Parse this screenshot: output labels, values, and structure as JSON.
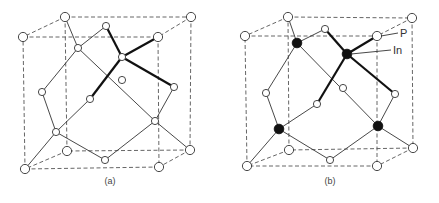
{
  "figure": {
    "panels": [
      {
        "id": "a",
        "caption": "(a)",
        "caption_pos": [
          110,
          184
        ],
        "cube_corners": {
          "back_tl": [
            65,
            17
          ],
          "back_tr": [
            191,
            17
          ],
          "back_bl": [
            67,
            151
          ],
          "back_br": [
            190,
            150
          ],
          "front_tl": [
            23,
            37
          ],
          "front_tr": [
            158,
            37
          ],
          "front_bl": [
            25,
            169
          ],
          "front_br": [
            159,
            167
          ]
        },
        "large_white_atoms": [
          [
            65,
            17
          ],
          [
            191,
            17
          ],
          [
            23,
            37
          ],
          [
            158,
            37
          ],
          [
            67,
            151
          ],
          [
            190,
            150
          ],
          [
            25,
            169
          ],
          [
            159,
            167
          ]
        ],
        "small_white_atoms": [
          [
            106,
            26
          ],
          [
            78,
            48
          ],
          [
            122,
            57
          ],
          [
            122,
            80
          ],
          [
            174,
            87
          ],
          [
            42,
            92
          ],
          [
            90,
            99
          ],
          [
            155,
            121
          ],
          [
            56,
            132
          ],
          [
            105,
            160
          ]
        ],
        "black_atoms": [],
        "thin_bonds": [
          [
            [
              78,
              48
            ],
            [
              65,
              17
            ]
          ],
          [
            [
              78,
              48
            ],
            [
              106,
              26
            ]
          ],
          [
            [
              78,
              48
            ],
            [
              42,
              92
            ]
          ],
          [
            [
              78,
              48
            ],
            [
              155,
              121
            ]
          ],
          [
            [
              42,
              92
            ],
            [
              56,
              132
            ]
          ],
          [
            [
              56,
              132
            ],
            [
              25,
              169
            ]
          ],
          [
            [
              56,
              132
            ],
            [
              90,
              99
            ]
          ],
          [
            [
              56,
              132
            ],
            [
              105,
              160
            ]
          ],
          [
            [
              105,
              160
            ],
            [
              155,
              121
            ]
          ],
          [
            [
              155,
              121
            ],
            [
              174,
              87
            ]
          ],
          [
            [
              155,
              121
            ],
            [
              190,
              150
            ]
          ]
        ],
        "thick_bonds": [
          [
            [
              122,
              57
            ],
            [
              106,
              26
            ]
          ],
          [
            [
              122,
              57
            ],
            [
              158,
              37
            ]
          ],
          [
            [
              122,
              57
            ],
            [
              174,
              87
            ]
          ],
          [
            [
              122,
              57
            ],
            [
              90,
              99
            ]
          ]
        ]
      },
      {
        "id": "b",
        "caption": "(b)",
        "caption_pos": [
          330,
          184
        ],
        "cube_corners": {
          "back_tl": [
            288,
            17
          ],
          "back_tr": [
            412,
            18
          ],
          "back_bl": [
            289,
            150
          ],
          "back_br": [
            413,
            148
          ],
          "front_tl": [
            245,
            36
          ],
          "front_tr": [
            377,
            36
          ],
          "front_bl": [
            247,
            166
          ],
          "front_br": [
            377,
            166
          ]
        },
        "large_white_atoms": [
          [
            288,
            17
          ],
          [
            412,
            18
          ],
          [
            245,
            36
          ],
          [
            377,
            36
          ],
          [
            289,
            150
          ],
          [
            413,
            148
          ],
          [
            247,
            166
          ],
          [
            377,
            166
          ]
        ],
        "small_white_atoms": [
          [
            325,
            29
          ],
          [
            343,
            88
          ],
          [
            395,
            94
          ],
          [
            266,
            93
          ],
          [
            317,
            104
          ],
          [
            330,
            160
          ]
        ],
        "black_atoms": [
          [
            297,
            43
          ],
          [
            347,
            54
          ],
          [
            279,
            129
          ],
          [
            378,
            126
          ]
        ],
        "thin_bonds": [
          [
            [
              297,
              43
            ],
            [
              288,
              17
            ]
          ],
          [
            [
              297,
              43
            ],
            [
              325,
              29
            ]
          ],
          [
            [
              297,
              43
            ],
            [
              266,
              93
            ]
          ],
          [
            [
              297,
              43
            ],
            [
              378,
              126
            ]
          ],
          [
            [
              266,
              93
            ],
            [
              279,
              129
            ]
          ],
          [
            [
              279,
              129
            ],
            [
              247,
              166
            ]
          ],
          [
            [
              279,
              129
            ],
            [
              317,
              104
            ]
          ],
          [
            [
              279,
              129
            ],
            [
              330,
              160
            ]
          ],
          [
            [
              330,
              160
            ],
            [
              378,
              126
            ]
          ],
          [
            [
              378,
              126
            ],
            [
              395,
              94
            ]
          ],
          [
            [
              378,
              126
            ],
            [
              413,
              148
            ]
          ]
        ],
        "thick_bonds": [
          [
            [
              347,
              54
            ],
            [
              325,
              29
            ]
          ],
          [
            [
              347,
              54
            ],
            [
              377,
              36
            ]
          ],
          [
            [
              347,
              54
            ],
            [
              395,
              94
            ]
          ],
          [
            [
              347,
              54
            ],
            [
              317,
              104
            ]
          ]
        ],
        "labels": [
          {
            "text": "P",
            "line_from": [
              381,
              36
            ],
            "line_to": [
              398,
              33
            ],
            "text_pos": [
              400,
              37
            ]
          },
          {
            "text": "In",
            "line_from": [
              351,
              54
            ],
            "line_to": [
              391,
              50
            ],
            "text_pos": [
              393,
              54
            ]
          }
        ]
      }
    ]
  }
}
